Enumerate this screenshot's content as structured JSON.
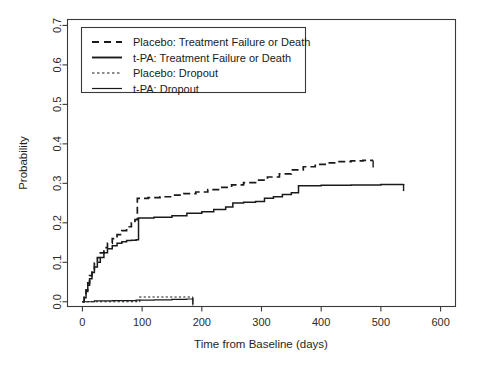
{
  "chart_data": {
    "type": "line",
    "title": "",
    "xlabel": "Time from Baseline (days)",
    "ylabel": "Probability",
    "xlim": [
      -25,
      625
    ],
    "ylim": [
      -0.012,
      0.715
    ],
    "xticks": [
      0,
      100,
      200,
      300,
      400,
      500,
      600
    ],
    "xtick_labels": [
      "0",
      "100",
      "200",
      "300",
      "400",
      "500",
      "600"
    ],
    "yticks": [
      0.0,
      0.1,
      0.2,
      0.3,
      0.4,
      0.5,
      0.6,
      0.7
    ],
    "ytick_labels": [
      "0.0",
      "0.1",
      "0.2",
      "0.3",
      "0.4",
      "0.5",
      "0.6",
      "0.7"
    ],
    "grid": false,
    "legend_position": "top-left",
    "series": [
      {
        "name": "Placebo: Treatment Failure or Death",
        "style": "dashed",
        "points": [
          [
            0,
            0.0
          ],
          [
            3,
            0.012
          ],
          [
            6,
            0.03
          ],
          [
            9,
            0.048
          ],
          [
            12,
            0.066
          ],
          [
            16,
            0.082
          ],
          [
            20,
            0.098
          ],
          [
            25,
            0.112
          ],
          [
            30,
            0.124
          ],
          [
            36,
            0.137
          ],
          [
            42,
            0.148
          ],
          [
            50,
            0.16
          ],
          [
            58,
            0.17
          ],
          [
            66,
            0.18
          ],
          [
            74,
            0.19
          ],
          [
            82,
            0.2
          ],
          [
            88,
            0.208
          ],
          [
            92,
            0.262
          ],
          [
            110,
            0.264
          ],
          [
            130,
            0.266
          ],
          [
            150,
            0.27
          ],
          [
            170,
            0.274
          ],
          [
            190,
            0.278
          ],
          [
            210,
            0.284
          ],
          [
            230,
            0.29
          ],
          [
            250,
            0.296
          ],
          [
            270,
            0.302
          ],
          [
            290,
            0.308
          ],
          [
            310,
            0.316
          ],
          [
            330,
            0.324
          ],
          [
            350,
            0.334
          ],
          [
            370,
            0.342
          ],
          [
            390,
            0.348
          ],
          [
            410,
            0.352
          ],
          [
            430,
            0.355
          ],
          [
            450,
            0.357
          ],
          [
            470,
            0.358
          ],
          [
            487,
            0.358
          ]
        ]
      },
      {
        "name": "t-PA: Treatment Failure or Death",
        "style": "solid",
        "points": [
          [
            0,
            0.0
          ],
          [
            3,
            0.01
          ],
          [
            6,
            0.026
          ],
          [
            9,
            0.042
          ],
          [
            12,
            0.058
          ],
          [
            16,
            0.074
          ],
          [
            20,
            0.088
          ],
          [
            25,
            0.1
          ],
          [
            30,
            0.112
          ],
          [
            36,
            0.124
          ],
          [
            42,
            0.134
          ],
          [
            50,
            0.142
          ],
          [
            58,
            0.148
          ],
          [
            66,
            0.152
          ],
          [
            74,
            0.155
          ],
          [
            82,
            0.156
          ],
          [
            90,
            0.157
          ],
          [
            94,
            0.212
          ],
          [
            120,
            0.214
          ],
          [
            150,
            0.218
          ],
          [
            175,
            0.224
          ],
          [
            200,
            0.228
          ],
          [
            220,
            0.234
          ],
          [
            240,
            0.24
          ],
          [
            252,
            0.25
          ],
          [
            270,
            0.252
          ],
          [
            290,
            0.254
          ],
          [
            305,
            0.262
          ],
          [
            320,
            0.266
          ],
          [
            335,
            0.272
          ],
          [
            350,
            0.276
          ],
          [
            362,
            0.294
          ],
          [
            400,
            0.295
          ],
          [
            450,
            0.296
          ],
          [
            500,
            0.297
          ],
          [
            538,
            0.298
          ]
        ]
      },
      {
        "name": "Placebo: Dropout",
        "style": "dotted",
        "points": [
          [
            0,
            0.0
          ],
          [
            20,
            0.0
          ],
          [
            50,
            0.0
          ],
          [
            80,
            0.0
          ],
          [
            92,
            0.0
          ],
          [
            96,
            0.012
          ],
          [
            120,
            0.012
          ],
          [
            150,
            0.012
          ],
          [
            175,
            0.012
          ],
          [
            185,
            0.012
          ]
        ]
      },
      {
        "name": "t-PA: Dropout",
        "style": "thin-solid",
        "points": [
          [
            0,
            0.0
          ],
          [
            20,
            0.002
          ],
          [
            50,
            0.003
          ],
          [
            90,
            0.004
          ],
          [
            120,
            0.005
          ],
          [
            150,
            0.006
          ],
          [
            175,
            0.007
          ],
          [
            185,
            0.008
          ]
        ]
      }
    ]
  },
  "legend": {
    "entries": [
      {
        "label": "Placebo: Treatment Failure or Death",
        "style": "dashed"
      },
      {
        "label": "t-PA: Treatment Failure or Death",
        "style": "solid"
      },
      {
        "label": "Placebo: Dropout",
        "style": "dotted"
      },
      {
        "label": "t-PA: Dropout",
        "style": "thin-solid"
      }
    ]
  },
  "colors": {
    "line": "#1a1a1a",
    "axis": "#3a3a3a",
    "background": "#ffffff"
  }
}
